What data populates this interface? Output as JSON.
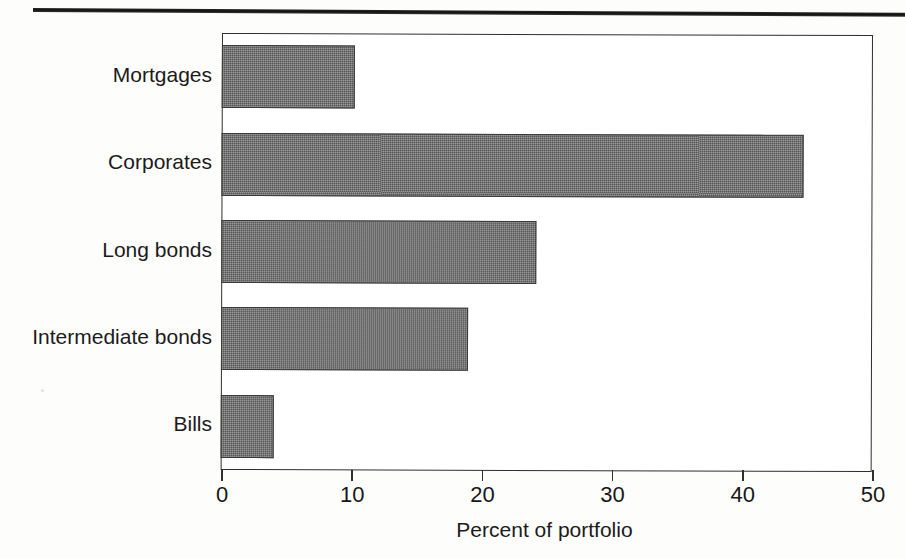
{
  "chart_data": {
    "type": "bar",
    "orientation": "horizontal",
    "title": "",
    "xlabel": "Percent of portfolio",
    "ylabel": "",
    "xlim": [
      0,
      50
    ],
    "xticks": [
      0,
      10,
      20,
      30,
      40,
      50
    ],
    "xtick_labels": [
      "0",
      "10",
      "20",
      "30",
      "40",
      "50"
    ],
    "grid": false,
    "legend": null,
    "categories": [
      "Mortgages",
      "Corporates",
      "Long bonds",
      "Intermediate bonds",
      "Bills"
    ],
    "values": [
      10.2,
      44.7,
      24.2,
      19.0,
      4.1
    ],
    "bar_color": "#6e6e6e",
    "bar_edge_color": "#3a3a3a",
    "frame_color": "#2f2f2f"
  },
  "axis": {
    "x_title": "Percent of portfolio",
    "ticks": [
      {
        "label": "0",
        "value": 0
      },
      {
        "label": "10",
        "value": 10
      },
      {
        "label": "20",
        "value": 20
      },
      {
        "label": "30",
        "value": 30
      },
      {
        "label": "40",
        "value": 40
      },
      {
        "label": "50",
        "value": 50
      }
    ]
  },
  "bars": [
    {
      "label": "Mortgages",
      "value": 10.2
    },
    {
      "label": "Corporates",
      "value": 44.7
    },
    {
      "label": "Long bonds",
      "value": 24.2
    },
    {
      "label": "Intermediate bonds",
      "value": 19.0
    },
    {
      "label": "Bills",
      "value": 4.1
    }
  ]
}
